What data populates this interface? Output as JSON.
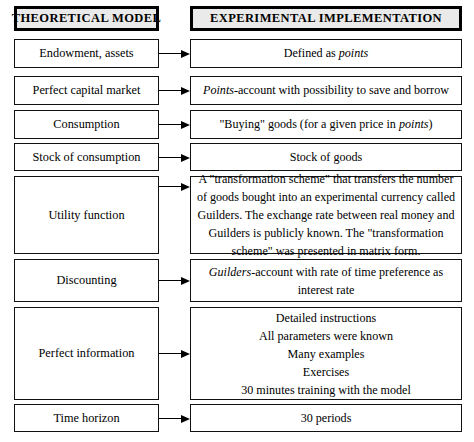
{
  "figure": {
    "type": "two-column-comparison-table",
    "headers": {
      "left": "THEORETICAL MODEL",
      "right": "EXPERIMENTAL IMPLEMENTATION"
    },
    "rows": [
      {
        "left": "Endowment, assets",
        "right_plain": "Defined as points",
        "right_html": "Defined as <i>points</i>"
      },
      {
        "left": "Perfect capital market",
        "right_plain": "Points-account with possibility to save and borrow",
        "right_html": "<i>Points</i>-account with possibility to save and borrow"
      },
      {
        "left": "Consumption",
        "right_plain": "\"Buying\" goods (for a given price in points)",
        "right_html": "\"Buying\" goods (for a given price in <i>points</i>)"
      },
      {
        "left": "Stock of consumption",
        "right_plain": "Stock of goods",
        "right_html": "Stock of goods"
      },
      {
        "left": "Utility function",
        "right_plain": "A \"transformation scheme\" that transfers the number of goods bought into an experimental currency called Guilders. The exchange rate between real money and Guilders is publicly known. The \"transformation scheme\" was presented in matrix form.",
        "right_html": "A \"transformation scheme\" that transfers the number of goods bought into an experimental currency called Guilders. The exchange rate between real money and Guilders is publicly known. The \"transformation scheme\" was presented in matrix form."
      },
      {
        "left": "Discounting",
        "right_plain": "Guilders-account with rate of time preference as interest rate",
        "right_html": "<i>Guilders</i>-account with rate of time preference as interest rate"
      },
      {
        "left": "Perfect information",
        "right_plain": "Detailed instructions All parameters were known Many examples Exercises 30 minutes training with the model",
        "right_html": "Detailed instructions<br>All parameters were known<br>Many examples<br>Exercises<br>30 minutes training with the model"
      },
      {
        "left": "Time horizon",
        "right_plain": "30 periods",
        "right_html": "30 periods"
      }
    ],
    "connector": "arrow-right",
    "colors": {
      "header_fill": "#eaeaea",
      "border": "#000000",
      "text": "#000000",
      "background": "#ffffff"
    }
  }
}
